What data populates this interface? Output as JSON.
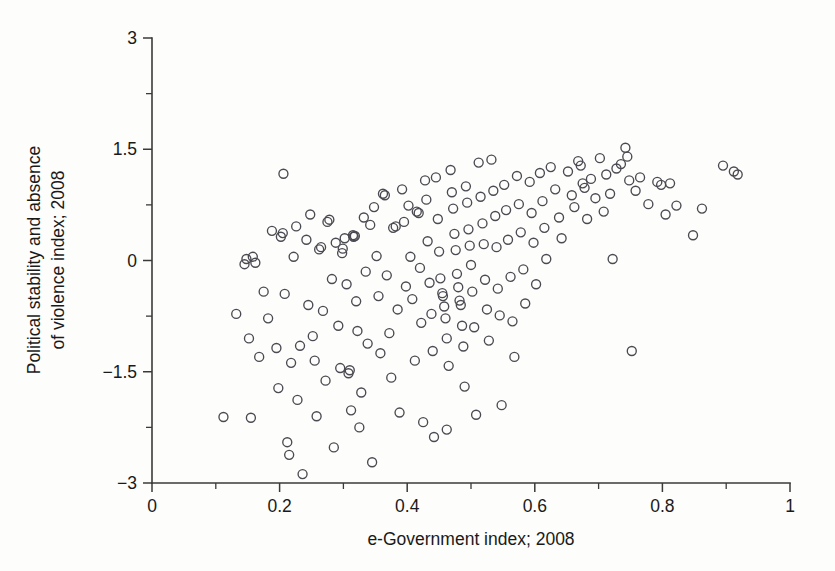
{
  "chart_data": {
    "type": "scatter",
    "title": "",
    "xlabel": "e-Government index; 2008",
    "ylabel_line1": "Political stability and absence",
    "ylabel_line2": "of violence index; 2008",
    "ylabel": "Political stability and absence of violence index; 2008",
    "xlim": [
      0,
      1
    ],
    "ylim": [
      -3,
      3
    ],
    "x_ticks": [
      0,
      0.2,
      0.4,
      0.6,
      0.8,
      1
    ],
    "x_tick_labels": [
      "0",
      "0.2",
      "0.4",
      "0.6",
      "0.8",
      "1"
    ],
    "x_minor_ticks": [
      0.1,
      0.3,
      0.5,
      0.7,
      0.9
    ],
    "y_ticks": [
      -3,
      -1.5,
      0,
      1.5,
      3
    ],
    "y_tick_labels": [
      "−3",
      "−1.5",
      "0",
      "1.5",
      "3"
    ],
    "y_minor_ticks": [
      -2.25,
      -0.75,
      0.75,
      2.25
    ],
    "grid": false,
    "legend": "none",
    "marker": "open-circle",
    "marker_color": "#4a4a52",
    "marker_size_px": 9,
    "n_points": 192,
    "points": [
      [
        0.112,
        -2.11
      ],
      [
        0.132,
        -0.72
      ],
      [
        0.145,
        -0.05
      ],
      [
        0.148,
        0.02
      ],
      [
        0.152,
        -1.05
      ],
      [
        0.155,
        -2.12
      ],
      [
        0.158,
        0.05
      ],
      [
        0.162,
        -0.03
      ],
      [
        0.168,
        -1.3
      ],
      [
        0.175,
        -0.42
      ],
      [
        0.182,
        -0.78
      ],
      [
        0.188,
        0.4
      ],
      [
        0.195,
        -1.18
      ],
      [
        0.198,
        -1.72
      ],
      [
        0.202,
        0.32
      ],
      [
        0.205,
        0.37
      ],
      [
        0.206,
        1.17
      ],
      [
        0.208,
        -0.45
      ],
      [
        0.212,
        -2.45
      ],
      [
        0.215,
        -2.62
      ],
      [
        0.218,
        -1.38
      ],
      [
        0.222,
        0.05
      ],
      [
        0.226,
        0.46
      ],
      [
        0.228,
        -1.88
      ],
      [
        0.232,
        -1.15
      ],
      [
        0.236,
        -2.88
      ],
      [
        0.242,
        0.28
      ],
      [
        0.245,
        -0.6
      ],
      [
        0.248,
        0.62
      ],
      [
        0.252,
        -1.02
      ],
      [
        0.255,
        -1.35
      ],
      [
        0.258,
        -2.1
      ],
      [
        0.262,
        0.15
      ],
      [
        0.265,
        0.18
      ],
      [
        0.268,
        -0.68
      ],
      [
        0.272,
        -1.62
      ],
      [
        0.275,
        0.52
      ],
      [
        0.278,
        0.55
      ],
      [
        0.282,
        -0.25
      ],
      [
        0.285,
        -2.52
      ],
      [
        0.288,
        0.24
      ],
      [
        0.292,
        -0.88
      ],
      [
        0.295,
        -1.45
      ],
      [
        0.298,
        0.1
      ],
      [
        0.299,
        0.16
      ],
      [
        0.302,
        0.3
      ],
      [
        0.305,
        -0.32
      ],
      [
        0.308,
        -1.52
      ],
      [
        0.31,
        -1.48
      ],
      [
        0.312,
        -2.02
      ],
      [
        0.315,
        0.34
      ],
      [
        0.316,
        0.32
      ],
      [
        0.318,
        0.33
      ],
      [
        0.32,
        -0.55
      ],
      [
        0.322,
        -0.95
      ],
      [
        0.325,
        -2.25
      ],
      [
        0.328,
        -1.78
      ],
      [
        0.332,
        0.58
      ],
      [
        0.335,
        -0.15
      ],
      [
        0.338,
        -1.12
      ],
      [
        0.342,
        0.48
      ],
      [
        0.345,
        -2.72
      ],
      [
        0.348,
        0.72
      ],
      [
        0.352,
        0.06
      ],
      [
        0.355,
        -0.48
      ],
      [
        0.358,
        -1.25
      ],
      [
        0.362,
        0.9
      ],
      [
        0.365,
        0.88
      ],
      [
        0.368,
        -0.2
      ],
      [
        0.372,
        -0.98
      ],
      [
        0.375,
        -1.58
      ],
      [
        0.378,
        0.44
      ],
      [
        0.382,
        0.46
      ],
      [
        0.385,
        -0.66
      ],
      [
        0.388,
        -2.05
      ],
      [
        0.392,
        0.96
      ],
      [
        0.395,
        0.52
      ],
      [
        0.398,
        -0.35
      ],
      [
        0.402,
        0.74
      ],
      [
        0.405,
        0.05
      ],
      [
        0.408,
        -0.52
      ],
      [
        0.412,
        -1.35
      ],
      [
        0.415,
        0.66
      ],
      [
        0.418,
        0.64
      ],
      [
        0.42,
        -0.1
      ],
      [
        0.422,
        -0.84
      ],
      [
        0.425,
        -2.18
      ],
      [
        0.428,
        1.08
      ],
      [
        0.43,
        0.82
      ],
      [
        0.432,
        0.26
      ],
      [
        0.435,
        -0.3
      ],
      [
        0.438,
        -0.72
      ],
      [
        0.44,
        -1.22
      ],
      [
        0.442,
        -2.38
      ],
      [
        0.445,
        1.12
      ],
      [
        0.448,
        0.56
      ],
      [
        0.45,
        0.12
      ],
      [
        0.452,
        -0.24
      ],
      [
        0.455,
        -0.44
      ],
      [
        0.456,
        -0.48
      ],
      [
        0.458,
        -0.62
      ],
      [
        0.46,
        -0.78
      ],
      [
        0.462,
        -1.05
      ],
      [
        0.465,
        -1.42
      ],
      [
        0.468,
        1.22
      ],
      [
        0.47,
        0.92
      ],
      [
        0.472,
        0.7
      ],
      [
        0.474,
        0.36
      ],
      [
        0.476,
        0.14
      ],
      [
        0.478,
        -0.18
      ],
      [
        0.48,
        -0.36
      ],
      [
        0.482,
        -0.54
      ],
      [
        0.484,
        -0.6
      ],
      [
        0.486,
        -0.88
      ],
      [
        0.488,
        -1.16
      ],
      [
        0.49,
        -1.7
      ],
      [
        0.492,
        1.0
      ],
      [
        0.494,
        0.78
      ],
      [
        0.496,
        0.42
      ],
      [
        0.498,
        0.2
      ],
      [
        0.5,
        -0.06
      ],
      [
        0.502,
        -0.42
      ],
      [
        0.505,
        -0.9
      ],
      [
        0.508,
        -2.08
      ],
      [
        0.512,
        1.32
      ],
      [
        0.515,
        0.86
      ],
      [
        0.518,
        0.5
      ],
      [
        0.52,
        0.22
      ],
      [
        0.522,
        -0.26
      ],
      [
        0.525,
        -0.66
      ],
      [
        0.528,
        -1.08
      ],
      [
        0.532,
        1.36
      ],
      [
        0.535,
        0.94
      ],
      [
        0.538,
        0.6
      ],
      [
        0.54,
        0.18
      ],
      [
        0.542,
        -0.38
      ],
      [
        0.545,
        -0.74
      ],
      [
        0.548,
        -1.95
      ],
      [
        0.552,
        1.02
      ],
      [
        0.555,
        0.68
      ],
      [
        0.558,
        0.28
      ],
      [
        0.562,
        -0.22
      ],
      [
        0.565,
        -0.82
      ],
      [
        0.568,
        -1.3
      ],
      [
        0.572,
        1.14
      ],
      [
        0.575,
        0.76
      ],
      [
        0.578,
        0.38
      ],
      [
        0.582,
        -0.12
      ],
      [
        0.585,
        -0.58
      ],
      [
        0.592,
        1.06
      ],
      [
        0.595,
        0.64
      ],
      [
        0.598,
        0.24
      ],
      [
        0.602,
        -0.32
      ],
      [
        0.608,
        1.18
      ],
      [
        0.612,
        0.8
      ],
      [
        0.615,
        0.44
      ],
      [
        0.618,
        0.02
      ],
      [
        0.625,
        1.26
      ],
      [
        0.632,
        0.96
      ],
      [
        0.638,
        0.58
      ],
      [
        0.642,
        0.3
      ],
      [
        0.652,
        1.2
      ],
      [
        0.658,
        0.88
      ],
      [
        0.662,
        0.72
      ],
      [
        0.668,
        1.34
      ],
      [
        0.672,
        1.28
      ],
      [
        0.675,
        1.04
      ],
      [
        0.678,
        0.98
      ],
      [
        0.682,
        0.56
      ],
      [
        0.688,
        1.1
      ],
      [
        0.695,
        0.84
      ],
      [
        0.702,
        1.38
      ],
      [
        0.708,
        0.66
      ],
      [
        0.712,
        1.16
      ],
      [
        0.718,
        0.9
      ],
      [
        0.722,
        0.02
      ],
      [
        0.728,
        1.24
      ],
      [
        0.735,
        1.3
      ],
      [
        0.742,
        1.52
      ],
      [
        0.745,
        1.4
      ],
      [
        0.748,
        1.08
      ],
      [
        0.752,
        -1.22
      ],
      [
        0.758,
        0.94
      ],
      [
        0.765,
        1.12
      ],
      [
        0.778,
        0.76
      ],
      [
        0.792,
        1.06
      ],
      [
        0.798,
        1.02
      ],
      [
        0.805,
        0.62
      ],
      [
        0.812,
        1.04
      ],
      [
        0.822,
        0.74
      ],
      [
        0.848,
        0.34
      ],
      [
        0.862,
        0.7
      ],
      [
        0.895,
        1.28
      ],
      [
        0.912,
        1.2
      ],
      [
        0.918,
        1.16
      ],
      [
        0.462,
        -2.28
      ]
    ]
  },
  "axes": {
    "x_axis_name": "x-axis",
    "y_axis_name": "y-axis"
  }
}
